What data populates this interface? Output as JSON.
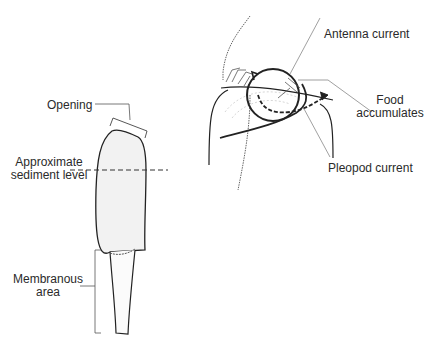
{
  "diagram": {
    "tube": {
      "labels": {
        "opening": "Opening",
        "sediment_line1": "Approximate",
        "sediment_line2": "sediment level",
        "membranous_line1": "Membranous",
        "membranous_line2": "area"
      }
    },
    "animal": {
      "labels": {
        "antenna_current": "Antenna current",
        "food_line1": "Food",
        "food_line2": "accumulates",
        "pleopod_current": "Pleopod current"
      }
    },
    "colors": {
      "line": "#222222",
      "tube_fill": "#f2f2f2",
      "leader": "#666666"
    }
  }
}
